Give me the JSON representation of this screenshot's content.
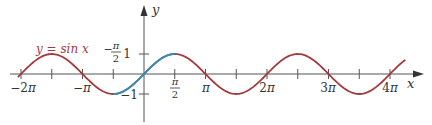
{
  "chart_data": {
    "type": "line",
    "title": "",
    "function_label": "y = sin x",
    "xlabel": "x",
    "ylabel": "y",
    "xlim_in_pi": [
      -2.05,
      4.6
    ],
    "ylim": [
      -1.7,
      1.6
    ],
    "x_ticks": [
      {
        "value_pi": -2,
        "label": "−2π"
      },
      {
        "value_pi": -1.5,
        "label": ""
      },
      {
        "value_pi": -1,
        "label": "−π"
      },
      {
        "value_pi": -0.5,
        "label": "−π/2"
      },
      {
        "value_pi": 0.5,
        "label": "π/2"
      },
      {
        "value_pi": 1,
        "label": "π"
      },
      {
        "value_pi": 1.5,
        "label": ""
      },
      {
        "value_pi": 2,
        "label": "2π"
      },
      {
        "value_pi": 2.5,
        "label": ""
      },
      {
        "value_pi": 3,
        "label": "3π"
      },
      {
        "value_pi": 3.5,
        "label": ""
      },
      {
        "value_pi": 4,
        "label": "4π"
      }
    ],
    "y_ticks": [
      {
        "value": 1,
        "label": "1"
      },
      {
        "value": -1,
        "label": "−1"
      }
    ],
    "series": [
      {
        "name": "y = sin x",
        "domain_pi": [
          -2.05,
          4.25
        ],
        "color": "#a33a3f"
      },
      {
        "name": "highlighted restriction",
        "domain_pi": [
          -0.5,
          0.5
        ],
        "color": "#2f8fb8"
      }
    ],
    "grid": false,
    "legend": "inline label near curve"
  },
  "colors": {
    "curve": "#a33a3f",
    "highlight": "#2f8fb8",
    "axis": "#555555",
    "text": "#333333"
  },
  "labels": {
    "function": "y = sin x",
    "x_axis": "x",
    "y_axis": "y",
    "neg_two_pi": "−2",
    "neg_pi": "−",
    "neg_half_pi_num": "π",
    "half_pi_num": "π",
    "half_den": "2",
    "pi": "π",
    "two_pi": "2",
    "three_pi": "3",
    "four_pi": "4",
    "y_one": "1",
    "y_neg_one": "−1",
    "minus": "−",
    "pi_symbol": "π"
  }
}
